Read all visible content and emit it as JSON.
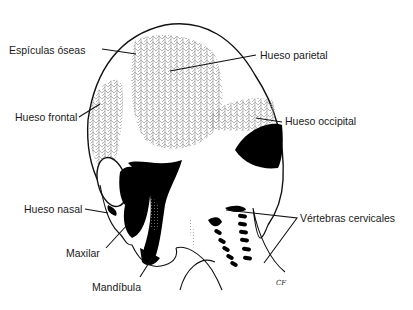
{
  "figure": {
    "signature": "CF",
    "colors": {
      "outline": "#111111",
      "bone_spicules": "#9a9a9a",
      "solid_bone": "#000000",
      "background": "#ffffff"
    }
  },
  "labels": [
    {
      "id": "espiculas",
      "text": "Espículas óseas"
    },
    {
      "id": "parietal",
      "text": "Hueso parietal"
    },
    {
      "id": "frontal",
      "text": "Hueso frontal"
    },
    {
      "id": "occipital",
      "text": "Hueso occipital"
    },
    {
      "id": "nasal",
      "text": "Hueso nasal"
    },
    {
      "id": "maxilar",
      "text": "Maxilar"
    },
    {
      "id": "mandibula",
      "text": "Mandíbula"
    },
    {
      "id": "vertebras",
      "text": "Vértebras cervicales"
    }
  ]
}
